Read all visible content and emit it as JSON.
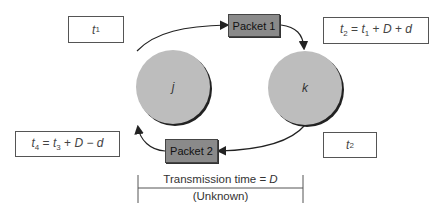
{
  "diagram": {
    "nodes": {
      "j": {
        "label": "j"
      },
      "k": {
        "label": "k"
      }
    },
    "packets": {
      "packet1": {
        "label": "Packet 1"
      },
      "packet2": {
        "label": "Packet 2"
      }
    },
    "time_boxes": {
      "t1": {
        "var": "t",
        "sub": "1"
      },
      "t2_formula": {
        "lhs_var": "t",
        "lhs_sub": "2",
        "eq": " = ",
        "t_var": "t",
        "t_sub": "1",
        "op1": " + ",
        "D": "D",
        "op2": " + ",
        "d": "d"
      },
      "t4_formula": {
        "lhs_var": "t",
        "lhs_sub": "4",
        "eq": " = ",
        "t_var": "t",
        "t_sub": "3",
        "op1": " + ",
        "D": "D",
        "op2": " − ",
        "d": "d"
      },
      "t2_at_k": {
        "var": "t",
        "sub": "2"
      }
    },
    "transmission": {
      "label": "Transmission time = ",
      "D": "D",
      "note": "(Unknown)"
    },
    "colors": {
      "node_fill": "#bdbdbd",
      "packet_fill": "#8a8a8a",
      "line": "#222222"
    }
  }
}
